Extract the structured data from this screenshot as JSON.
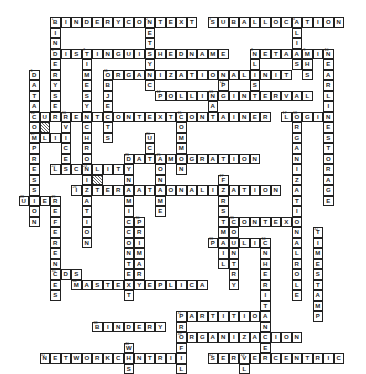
{
  "puzzle": {
    "type": "crossword",
    "cell_size": 10.5,
    "origin_x": 18.5,
    "origin_y": 17,
    "words": [
      {
        "num": 1,
        "dir": "across",
        "col": 3,
        "row": 0,
        "answer": "BINDERYCONTEXT"
      },
      {
        "num": 1,
        "dir": "down",
        "col": 3,
        "row": 0,
        "answer": "BINDERYSE"
      },
      {
        "num": 2,
        "dir": "down",
        "col": 12,
        "row": 0,
        "answer": "NETSYNC"
      },
      {
        "num": 3,
        "dir": "across",
        "col": 18,
        "row": 0,
        "answer": "SUBALLOCATION"
      },
      {
        "num": 4,
        "dir": "down",
        "col": 26,
        "row": 0,
        "answer": "ALIAS"
      },
      {
        "num": 5,
        "dir": "across",
        "col": 3,
        "row": 3,
        "answer": "DISTINGUISHEDNAME"
      },
      {
        "num": 6,
        "dir": "down",
        "col": 1,
        "row": 5,
        "answer": "DATACOMPRESSION"
      },
      {
        "num": 7,
        "dir": "down",
        "col": 6,
        "row": 3,
        "answer": "TIMESYNCHRONIZATION"
      },
      {
        "num": 8,
        "dir": "across",
        "col": 22,
        "row": 3,
        "answer": "NETADMIN"
      },
      {
        "num": 8,
        "dir": "down",
        "col": 22,
        "row": 3,
        "answer": "NLIS"
      },
      {
        "num": 9,
        "dir": "down",
        "col": 27,
        "row": 3,
        "answer": "MHS"
      },
      {
        "num": 10,
        "dir": "down",
        "col": 29,
        "row": 3,
        "answer": "NEARLINESTORAGE"
      },
      {
        "num": 11,
        "dir": "across",
        "col": 8,
        "row": 5,
        "answer": "ORGANIZATIONALUNIT"
      },
      {
        "num": 11,
        "dir": "down",
        "col": 8,
        "row": 5,
        "answer": "OBJECTS"
      },
      {
        "num": 12,
        "dir": "down",
        "col": 19,
        "row": 6,
        "answer": "P"
      },
      {
        "num": 12,
        "dir": "across",
        "col": 13,
        "row": 7,
        "answer": "POLLINGINTERVAL"
      },
      {
        "num": 13,
        "dir": "down",
        "col": 18,
        "row": 7,
        "answer": "LA"
      },
      {
        "num": 14,
        "dir": "across",
        "col": 1,
        "row": 9,
        "answer": "CURRENTCONTEXT"
      },
      {
        "num": 15,
        "dir": "across",
        "col": 15,
        "row": 9,
        "answer": "CONTAINER"
      },
      {
        "num": 15,
        "dir": "down",
        "col": 15,
        "row": 9,
        "answer": "COMMON"
      },
      {
        "num": 16,
        "dir": "down",
        "col": 4,
        "row": 9,
        "answer": "RVICES"
      },
      {
        "num": 17,
        "dir": "across",
        "col": 25,
        "row": 9,
        "answer": "LOGIN"
      },
      {
        "num": 18,
        "dir": "down",
        "col": 26,
        "row": 9,
        "answer": "ORGANIZATIONALROLE"
      },
      {
        "num": 19,
        "dir": "across",
        "col": 1,
        "row": 11,
        "answer": "MLID"
      },
      {
        "num": 20,
        "dir": "down",
        "col": 12,
        "row": 11,
        "answer": "UC"
      },
      {
        "num": 21,
        "dir": "across",
        "col": 10,
        "row": 13,
        "answer": "DATAMIGRATION"
      },
      {
        "num": 22,
        "dir": "across",
        "col": 3,
        "row": 14,
        "answer": "LOCALITY"
      },
      {
        "num": 23,
        "dir": "down",
        "col": 6,
        "row": 14,
        "answer": "CU"
      },
      {
        "num": 24,
        "dir": "down",
        "col": 10,
        "row": 13,
        "answer": "DYNAMICCONTEXT"
      },
      {
        "num": 25,
        "dir": "down",
        "col": 13,
        "row": 13,
        "answer": "IONAME"
      },
      {
        "num": 26,
        "dir": "across",
        "col": 5,
        "row": 16,
        "answer": "INTERNATIONALIZATION"
      },
      {
        "num": 27,
        "dir": "down",
        "col": 19,
        "row": 15,
        "answer": "FIRSTMAIL"
      },
      {
        "num": 28,
        "dir": "across",
        "col": 0,
        "row": 17,
        "answer": "USER"
      },
      {
        "num": 29,
        "dir": "down",
        "col": 3,
        "row": 17,
        "answer": "REFERENCES"
      },
      {
        "num": 30,
        "dir": "down",
        "col": 11,
        "row": 19,
        "answer": "PRIMARY"
      },
      {
        "num": 31,
        "dir": "across",
        "col": 20,
        "row": 19,
        "answer": "CONTEXT"
      },
      {
        "num": 31,
        "dir": "down",
        "col": 20,
        "row": 19,
        "answer": "COUNTRY"
      },
      {
        "num": 32,
        "dir": "down",
        "col": 28,
        "row": 20,
        "answer": "TIMESTAMP"
      },
      {
        "num": 33,
        "dir": "across",
        "col": 18,
        "row": 21,
        "answer": "PUBLIC"
      },
      {
        "num": 34,
        "dir": "down",
        "col": 23,
        "row": 21,
        "answer": "INHERITANCE"
      },
      {
        "num": 35,
        "dir": "across",
        "col": 3,
        "row": 24,
        "answer": "NDS"
      },
      {
        "num": 36,
        "dir": "across",
        "col": 5,
        "row": 25,
        "answer": "MASTERREPLICA"
      },
      {
        "num": 37,
        "dir": "across",
        "col": 15,
        "row": 28,
        "answer": "PARTITION"
      },
      {
        "num": 37,
        "dir": "down",
        "col": 15,
        "row": 28,
        "answer": "PROFILE"
      },
      {
        "num": 38,
        "dir": "across",
        "col": 7,
        "row": 29,
        "answer": "BINDERY"
      },
      {
        "num": 39,
        "dir": "across",
        "col": 15,
        "row": 30,
        "answer": "ORGANIZATION"
      },
      {
        "num": 40,
        "dir": "down",
        "col": 10,
        "row": 31,
        "answer": "WHS"
      },
      {
        "num": 41,
        "dir": "across",
        "col": 2,
        "row": 32,
        "answer": "NETWORKCENTRIC"
      },
      {
        "num": 42,
        "dir": "across",
        "col": 18,
        "row": 32,
        "answer": "SERVERCENTRIC"
      },
      {
        "num": 43,
        "dir": "down",
        "col": 21,
        "row": 32,
        "answer": "VL"
      },
      {
        "num": 44,
        "dir": "across",
        "col": 5,
        "row": 34,
        "answer": "FILESYSTEM"
      },
      {
        "num": 45,
        "dir": "across",
        "col": 20,
        "row": 34,
        "answer": "TIMESERVER"
      }
    ],
    "hatched_cells": [
      {
        "col": 2,
        "row": 10
      },
      {
        "col": 7,
        "row": 15
      }
    ]
  },
  "colors": {
    "line": "#222222",
    "background": "#ffffff",
    "hatch": "#666666"
  }
}
